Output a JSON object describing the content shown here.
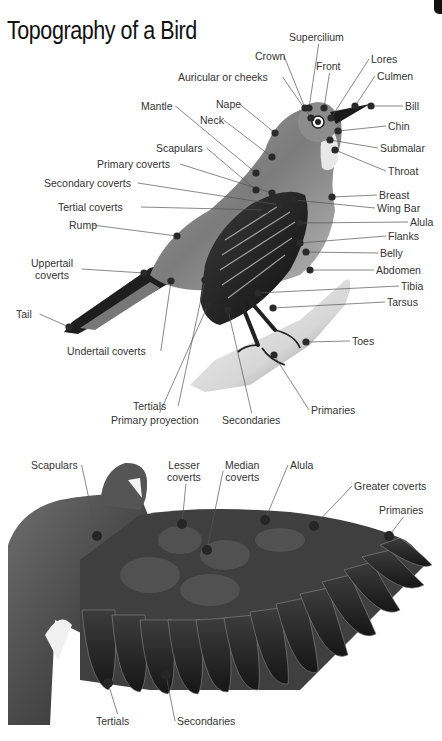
{
  "title": "Topography of a Bird",
  "colors": {
    "background": "#ffffff",
    "label_text": "#333333",
    "leader_line": "#555555",
    "marker_dot": "#2a2a2a"
  },
  "figure_top": {
    "description": "Perched songbird side view with labeled body parts",
    "labels": [
      {
        "id": "supercilium",
        "text": "Supercilium",
        "x": 289,
        "y": 31,
        "dot": [
          309,
          108
        ]
      },
      {
        "id": "crown",
        "text": "Crown",
        "x": 255,
        "y": 50,
        "dot": [
          305,
          108
        ]
      },
      {
        "id": "front",
        "text": "Front",
        "x": 316,
        "y": 60,
        "dot": [
          324,
          108
        ]
      },
      {
        "id": "lores",
        "text": "Lores",
        "x": 371,
        "y": 53,
        "dot": [
          331,
          118
        ]
      },
      {
        "id": "culmen",
        "text": "Culmen",
        "x": 377,
        "y": 70,
        "dot": [
          355,
          106
        ]
      },
      {
        "id": "auricular",
        "text": "Auricular or cheeks",
        "x": 178,
        "y": 71,
        "dot": [
          311,
          118
        ]
      },
      {
        "id": "bill",
        "text": "Bill",
        "x": 405,
        "y": 100,
        "dot": [
          371,
          106
        ]
      },
      {
        "id": "mantle",
        "text": "Mantle",
        "x": 141,
        "y": 100,
        "dot": [
          256,
          173
        ]
      },
      {
        "id": "nape",
        "text": "Nape",
        "x": 216,
        "y": 98,
        "dot": [
          275,
          133
        ]
      },
      {
        "id": "neck",
        "text": "Neck",
        "x": 200,
        "y": 114,
        "dot": [
          272,
          157
        ]
      },
      {
        "id": "chin",
        "text": "Chin",
        "x": 388,
        "y": 120,
        "dot": [
          338,
          131
        ]
      },
      {
        "id": "submalar",
        "text": "Submalar",
        "x": 380,
        "y": 142,
        "dot": [
          330,
          140
        ]
      },
      {
        "id": "throat",
        "text": "Throat",
        "x": 388,
        "y": 165,
        "dot": [
          335,
          150
        ]
      },
      {
        "id": "scapulars",
        "text": "Scapulars",
        "x": 156,
        "y": 142,
        "dot": [
          256,
          190
        ]
      },
      {
        "id": "primary-coverts",
        "text": "Primary coverts",
        "x": 97,
        "y": 158,
        "dot": [
          272,
          193
        ]
      },
      {
        "id": "secondary-coverts",
        "text": "Secondary coverts",
        "x": 44,
        "y": 177,
        "dot": [
          280,
          205
        ]
      },
      {
        "id": "breast",
        "text": "Breast",
        "x": 379,
        "y": 189,
        "dot": [
          332,
          197
        ]
      },
      {
        "id": "wing-bar",
        "text": "Wing Bar",
        "x": 377,
        "y": 202,
        "dot": [
          294,
          200
        ]
      },
      {
        "id": "tertial-coverts",
        "text": "Tertial coverts",
        "x": 58,
        "y": 201,
        "dot": [
          265,
          210
        ]
      },
      {
        "id": "alula",
        "text": "Alula",
        "x": 410,
        "y": 216,
        "dot": [
          300,
          223
        ]
      },
      {
        "id": "rump",
        "text": "Rump",
        "x": 69,
        "y": 219,
        "dot": [
          177,
          236
        ]
      },
      {
        "id": "flanks",
        "text": "Flanks",
        "x": 388,
        "y": 230,
        "dot": [
          300,
          243
        ]
      },
      {
        "id": "belly",
        "text": "Belly",
        "x": 380,
        "y": 247,
        "dot": [
          306,
          252
        ]
      },
      {
        "id": "uppertail-coverts",
        "text": "Uppertail\ncoverts",
        "x": 31,
        "y": 257,
        "dot": [
          144,
          273
        ]
      },
      {
        "id": "abdomen",
        "text": "Abdomen",
        "x": 376,
        "y": 264,
        "dot": [
          310,
          270
        ]
      },
      {
        "id": "tibia",
        "text": "Tibia",
        "x": 401,
        "y": 280,
        "dot": [
          258,
          293
        ]
      },
      {
        "id": "tarsus",
        "text": "Tarsus",
        "x": 387,
        "y": 296,
        "dot": [
          273,
          308
        ]
      },
      {
        "id": "tail",
        "text": "Tail",
        "x": 16,
        "y": 308,
        "dot": [
          69,
          327
        ]
      },
      {
        "id": "toes",
        "text": "Toes",
        "x": 352,
        "y": 335,
        "dot": [
          306,
          342
        ]
      },
      {
        "id": "undertail-coverts",
        "text": "Undertail coverts",
        "x": 67,
        "y": 345,
        "dot": [
          171,
          281
        ]
      },
      {
        "id": "primaries",
        "text": "Primaries",
        "x": 311,
        "y": 404,
        "dot": [
          274,
          355
        ]
      },
      {
        "id": "tertials",
        "text": "Tertials",
        "x": 133,
        "y": 400,
        "dot": [
          205,
          280
        ]
      },
      {
        "id": "primary-proyection",
        "text": "Primary proyection",
        "x": 111,
        "y": 414,
        "dot": [
          208,
          305
        ]
      },
      {
        "id": "secondaries",
        "text": "Secondaries",
        "x": 222,
        "y": 414,
        "dot": [
          228,
          310
        ]
      }
    ]
  },
  "figure_bottom": {
    "description": "Spread wing of a pigeon, dorsal view, with labeled feather groups",
    "labels": [
      {
        "id": "scapulars",
        "text": "Scapulars",
        "x": 31,
        "y": 459,
        "dot": [
          97,
          536
        ]
      },
      {
        "id": "lesser-coverts",
        "text": "Lesser\ncoverts",
        "x": 167,
        "y": 459,
        "dot": [
          182,
          524
        ]
      },
      {
        "id": "median-coverts",
        "text": "Median\ncoverts",
        "x": 225,
        "y": 459,
        "dot": [
          207,
          550
        ]
      },
      {
        "id": "alula",
        "text": "Alula",
        "x": 290,
        "y": 459,
        "dot": [
          265,
          520
        ]
      },
      {
        "id": "greater-coverts",
        "text": "Greater coverts",
        "x": 354,
        "y": 480,
        "dot": [
          314,
          526
        ]
      },
      {
        "id": "primaries",
        "text": "Primaries",
        "x": 379,
        "y": 504,
        "dot": [
          389,
          536
        ]
      },
      {
        "id": "tertials",
        "text": "Tertials",
        "x": 96,
        "y": 715,
        "dot": [
          108,
          683
        ]
      },
      {
        "id": "secondaries",
        "text": "Secondaries",
        "x": 177,
        "y": 715,
        "dot": [
          166,
          675
        ]
      }
    ]
  }
}
